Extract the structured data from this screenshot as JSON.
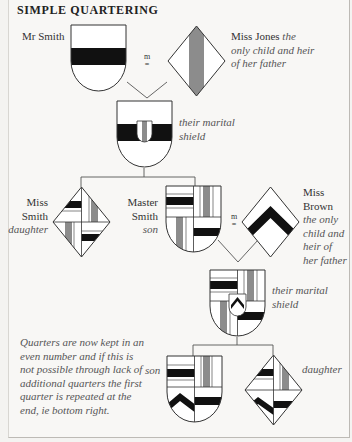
{
  "title": "SIMPLE QUARTERING",
  "colors": {
    "sable": "#111111",
    "argent": "#ffffff",
    "gray": "#8c8c8c",
    "outline": "#333333",
    "background": "#f8f7f5"
  },
  "labels": {
    "mr_smith": "Mr Smith",
    "marriage_symbol_1": "m",
    "miss_jones_name": "Miss Jones",
    "miss_jones_desc_1": "the",
    "miss_jones_desc_2": "only child and heir",
    "miss_jones_desc_3": "of her father",
    "marital_1_line1": "their marital",
    "marital_1_line2": "shield",
    "miss_smith_line1": "Miss",
    "miss_smith_line2": "Smith",
    "miss_smith_role": "daughter",
    "master_smith_line1": "Master",
    "master_smith_line2": "Smith",
    "master_smith_role": "son",
    "marriage_symbol_2": "m",
    "miss_brown_line1": "Miss",
    "miss_brown_line2": "Brown",
    "miss_brown_desc_1": "the only",
    "miss_brown_desc_2": "child and",
    "miss_brown_desc_3": "heir of",
    "miss_brown_desc_4": "her father",
    "marital_2_line1": "their marital",
    "marital_2_line2": "shield",
    "son": "son",
    "daughter": "daughter"
  },
  "note": [
    "Quarters are now kept in an",
    "even number and if this is",
    "not possible through lack of",
    "additional quarters the first",
    "quarter is repeated at the",
    "end, ie bottom right."
  ]
}
